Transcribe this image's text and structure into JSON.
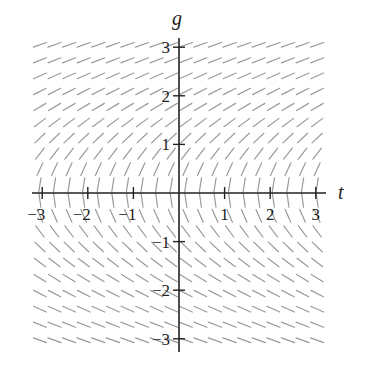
{
  "chart_data": {
    "type": "slope-field",
    "title": "",
    "xlabel": "t",
    "ylabel": "g",
    "xlim": [
      -3,
      3
    ],
    "ylim": [
      -3,
      3
    ],
    "xticks": [
      -3,
      -2,
      -1,
      1,
      2,
      3
    ],
    "yticks": [
      -3,
      -2,
      -1,
      1,
      2,
      3
    ],
    "xtick_labels": [
      "−3",
      "−2",
      "−1",
      "1",
      "2",
      "3"
    ],
    "ytick_labels": [
      "−3",
      "−2",
      "−1",
      "1",
      "2",
      "3"
    ],
    "grid": false,
    "field": {
      "equation": "dg/dt = 1/g",
      "t_start": -3.05,
      "t_step": 0.32,
      "t_count": 20,
      "g_start": 3.05,
      "g_step": -0.32,
      "g_count": 20,
      "segment_length_px": 14,
      "color": "#9a9a9a"
    },
    "layout": {
      "origin_px": [
        179,
        193
      ],
      "px_per_unit_x": 45.6,
      "px_per_unit_y": 48.6,
      "axis_color": "#222222"
    }
  }
}
